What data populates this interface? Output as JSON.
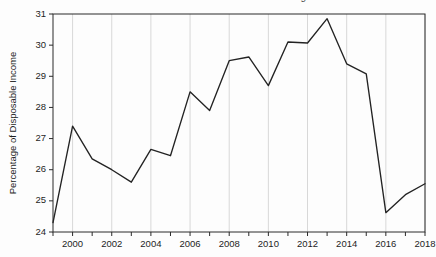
{
  "figure": {
    "clipped_title": "Household Debt Service and Financial Obligations",
    "background_color": "#fdfdfd",
    "line_color": "#232323",
    "grid_color": "#d8d8d8",
    "axis_color": "#2a2a2a"
  },
  "chart_data": {
    "type": "line",
    "title": "",
    "xlabel": "",
    "ylabel": "Percentage of Disposable Income",
    "xlim": [
      1999,
      2018
    ],
    "ylim": [
      24,
      31
    ],
    "yticks": [
      24,
      25,
      26,
      27,
      28,
      29,
      30,
      31
    ],
    "ytick_labels": [
      "24",
      "25",
      "26",
      "27",
      "28",
      "29",
      "30",
      "31"
    ],
    "xticks": [
      2000,
      2002,
      2004,
      2006,
      2008,
      2010,
      2012,
      2014,
      2016,
      2018
    ],
    "xtick_labels": [
      "2000",
      "2002",
      "2004",
      "2006",
      "2008",
      "2010",
      "2012",
      "2014",
      "2016",
      "2018"
    ],
    "x_minor_ticks": [
      1999,
      2000,
      2001,
      2002,
      2003,
      2004,
      2005,
      2006,
      2007,
      2008,
      2009,
      2010,
      2011,
      2012,
      2013,
      2014,
      2015,
      2016,
      2017,
      2018
    ],
    "grid": {
      "vertical": true,
      "horizontal": false,
      "vertical_at": [
        2000,
        2002,
        2004,
        2006,
        2008,
        2010,
        2012,
        2014,
        2016,
        2018
      ]
    },
    "legend": null,
    "x": [
      1999,
      2000,
      2001,
      2002,
      2003,
      2004,
      2005,
      2006,
      2007,
      2008,
      2009,
      2010,
      2011,
      2012,
      2013,
      2014,
      2015,
      2016,
      2017,
      2018
    ],
    "values": [
      24.3,
      27.4,
      26.35,
      26.0,
      25.6,
      26.65,
      26.45,
      28.5,
      27.9,
      29.5,
      29.62,
      28.7,
      30.1,
      30.07,
      30.85,
      29.4,
      29.08,
      24.62,
      25.2,
      25.55
    ]
  }
}
